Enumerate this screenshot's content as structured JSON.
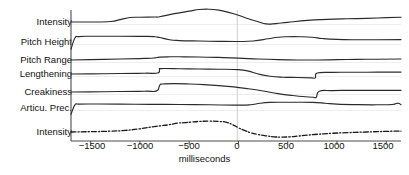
{
  "chart_data": {
    "type": "line",
    "title": "",
    "subtitle": "",
    "xlabel": "milliseconds",
    "ylabel": "",
    "xlim": [
      -1700,
      1650
    ],
    "ylim": [
      0,
      1
    ],
    "grid": false,
    "legend_position": "left-row-labels",
    "xticks": [
      -1500,
      -1000,
      -500,
      0,
      500,
      1000,
      1500
    ],
    "xticklabels": [
      "−1500",
      "−1000",
      "−500",
      "0",
      "500",
      "1000",
      "1500"
    ],
    "annotations": [
      {
        "name": "zero-reference-line",
        "x": 0,
        "style": "thin vertical grey line"
      }
    ],
    "row_labels": [
      "Intensity",
      "Pitch Height",
      "Pitch Range",
      "Lengthening",
      "Creakiness",
      "Articu. Prec.",
      "Intensity"
    ],
    "series": [
      {
        "name": "Intensity",
        "label": "Intensity",
        "linestyle": "solid",
        "color": "#2b2b2b",
        "baseline_px": 22,
        "x": [
          -1700,
          -1500,
          -1300,
          -1200,
          -1100,
          -1000,
          -850,
          -800,
          -650,
          -500,
          -400,
          -300,
          -200,
          -100,
          0,
          100,
          200,
          280,
          380,
          500,
          700,
          900,
          1100,
          1300,
          1500,
          1650
        ],
        "values": [
          0.0,
          0.0,
          0.03,
          0.15,
          0.28,
          0.3,
          0.31,
          0.33,
          0.52,
          0.68,
          0.78,
          0.8,
          0.74,
          0.6,
          0.42,
          0.2,
          0.02,
          -0.12,
          -0.1,
          -0.02,
          0.1,
          0.16,
          0.2,
          0.23,
          0.27,
          0.3
        ]
      },
      {
        "name": "Pitch Height",
        "label": "Pitch Height",
        "linestyle": "solid",
        "color": "#2b2b2b",
        "baseline_px": 42,
        "x": [
          -1700,
          -1660,
          -1620,
          -1500,
          -1200,
          -950,
          -850,
          -800,
          -700,
          -600,
          -400,
          -200,
          0,
          150,
          300,
          400,
          500,
          620,
          750,
          850,
          1000,
          1200,
          1400,
          1650
        ],
        "values": [
          -0.45,
          0.25,
          0.34,
          0.36,
          0.36,
          0.35,
          0.33,
          0.28,
          0.14,
          0.09,
          0.06,
          0.04,
          0.03,
          0.06,
          0.2,
          0.3,
          0.33,
          0.33,
          0.3,
          0.22,
          0.16,
          0.14,
          0.14,
          0.15
        ]
      },
      {
        "name": "Pitch Range",
        "label": "Pitch Range",
        "linestyle": "solid",
        "color": "#2b2b2b",
        "baseline_px": 60,
        "x": [
          -1700,
          -1500,
          -1200,
          -950,
          -850,
          -800,
          -700,
          -600,
          -400,
          -200,
          0,
          200,
          400,
          600,
          800,
          1000,
          1200,
          1400,
          1650
        ],
        "values": [
          0.0,
          0.02,
          0.06,
          0.1,
          0.13,
          0.18,
          0.2,
          0.2,
          0.19,
          0.16,
          0.12,
          0.06,
          0.02,
          0.0,
          0.0,
          0.02,
          0.04,
          0.05,
          0.06
        ]
      },
      {
        "name": "Lengthening",
        "label": "Lengthening",
        "linestyle": "solid",
        "color": "#2b2b2b",
        "baseline_px": 74,
        "x": [
          -1700,
          -1500,
          -1200,
          -950,
          -820,
          -800,
          -780,
          -600,
          -400,
          -200,
          0,
          100,
          200,
          320,
          450,
          600,
          740,
          780,
          800,
          950,
          1100,
          1300,
          1500,
          1650
        ],
        "values": [
          0.0,
          0.01,
          0.03,
          0.05,
          0.06,
          0.3,
          0.34,
          0.33,
          0.31,
          0.3,
          0.27,
          0.18,
          0.0,
          -0.14,
          -0.2,
          -0.22,
          -0.24,
          -0.24,
          0.06,
          0.1,
          0.11,
          0.11,
          0.12,
          0.12
        ]
      },
      {
        "name": "Creakiness",
        "label": "Creakiness",
        "linestyle": "solid",
        "color": "#2b2b2b",
        "baseline_px": 92,
        "x": [
          -1700,
          -1500,
          -1200,
          -950,
          -830,
          -800,
          -770,
          -650,
          -500,
          -350,
          -200,
          -50,
          100,
          250,
          400,
          550,
          680,
          760,
          790,
          820,
          950,
          1100,
          1300,
          1500,
          1650
        ],
        "values": [
          0.0,
          0.01,
          0.03,
          0.05,
          0.07,
          0.42,
          0.5,
          0.52,
          0.5,
          0.46,
          0.4,
          0.32,
          0.2,
          0.06,
          -0.1,
          -0.22,
          -0.3,
          -0.33,
          -0.33,
          0.05,
          0.09,
          0.1,
          0.1,
          0.1,
          0.1
        ]
      },
      {
        "name": "Articu. Prec.",
        "label": "Articu. Prec.",
        "linestyle": "solid",
        "color": "#2b2b2b",
        "baseline_px": 108,
        "x": [
          -1700,
          -1660,
          -1620,
          -1500,
          -1200,
          -900,
          -600,
          -300,
          0,
          120,
          220,
          320,
          450,
          600,
          750,
          880,
          1000,
          1200,
          1400,
          1560,
          1620,
          1650
        ],
        "values": [
          -0.4,
          0.2,
          0.24,
          0.25,
          0.24,
          0.23,
          0.22,
          0.2,
          0.18,
          0.2,
          0.3,
          0.35,
          0.36,
          0.36,
          0.35,
          0.3,
          0.24,
          0.21,
          0.2,
          0.22,
          0.3,
          0.2
        ]
      },
      {
        "name": "Intensity (bottom)",
        "label": "Intensity",
        "linestyle": "dashdot",
        "color": "#1a1a1a",
        "baseline_px": 132,
        "x": [
          -1700,
          -1500,
          -1300,
          -1150,
          -1000,
          -900,
          -800,
          -700,
          -620,
          -550,
          -480,
          -400,
          -300,
          -200,
          -120,
          -40,
          0,
          60,
          130,
          200,
          280,
          360,
          440,
          520,
          600,
          700,
          800,
          950,
          1100,
          1300,
          1500,
          1650
        ],
        "values": [
          0.0,
          0.02,
          0.05,
          0.1,
          0.2,
          0.3,
          0.38,
          0.46,
          0.56,
          0.58,
          0.62,
          0.66,
          0.68,
          0.66,
          0.6,
          0.4,
          0.26,
          0.1,
          -0.06,
          -0.16,
          -0.24,
          -0.3,
          -0.32,
          -0.3,
          -0.26,
          -0.2,
          -0.14,
          -0.08,
          -0.04,
          0.0,
          0.04,
          0.06
        ]
      }
    ]
  },
  "axis": {
    "xlabel": "milliseconds",
    "ticks": [
      {
        "label": "−1500",
        "value": -1500
      },
      {
        "label": "−1000",
        "value": -1000
      },
      {
        "label": "−500",
        "value": -500
      },
      {
        "label": "0",
        "value": 0
      },
      {
        "label": "500",
        "value": 500
      },
      {
        "label": "1000",
        "value": 1000
      },
      {
        "label": "1500",
        "value": 1500
      }
    ]
  },
  "colors": {
    "line": "#2b2b2b",
    "axis": "#4d4d4d",
    "gridline": "#c9c9c9",
    "text": "#111111",
    "background": "#ffffff"
  }
}
